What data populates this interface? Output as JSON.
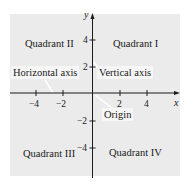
{
  "diagram": {
    "colors": {
      "background": "#ebebeb",
      "axis": "#1a1a1a",
      "label_box": "#f6f6f6",
      "pointer": "#ffffff"
    },
    "axes": {
      "x_label": "x",
      "y_label": "y",
      "x_ticks": [
        {
          "value": -4,
          "label": "−4"
        },
        {
          "value": -2,
          "label": "−2"
        },
        {
          "value": 2,
          "label": "2"
        },
        {
          "value": 4,
          "label": "4"
        }
      ],
      "y_ticks": [
        {
          "value": 4,
          "label": "4"
        },
        {
          "value": 2,
          "label": "2"
        },
        {
          "value": -2,
          "label": "−2"
        },
        {
          "value": -4,
          "label": "−4"
        }
      ]
    },
    "quadrants": {
      "q1": "Quadrant I",
      "q2": "Quadrant II",
      "q3": "Quadrant III",
      "q4": "Quadrant IV"
    },
    "callouts": {
      "horizontal_axis": "Horizontal axis",
      "vertical_axis": "Vertical axis",
      "origin": "Origin"
    }
  }
}
